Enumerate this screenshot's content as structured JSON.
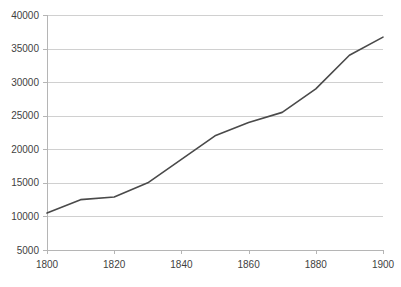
{
  "chart_data": {
    "type": "line",
    "title": "",
    "subtitle": "",
    "xlabel": "",
    "ylabel": "",
    "xlim": [
      1800,
      1900
    ],
    "ylim": [
      5000,
      40000
    ],
    "grid": true,
    "legend": false,
    "legend_position": "none",
    "line_color": "#4a4a4a",
    "gridline_color": "#d0d0d0",
    "axis_color": "#b5b5b5",
    "label_color": "#3f3f3f",
    "background_color": "#ffffff",
    "y_ticks": [
      5000,
      10000,
      15000,
      20000,
      25000,
      30000,
      35000,
      40000
    ],
    "y_tick_labels": [
      "5000",
      "10000",
      "15000",
      "20000",
      "25000",
      "30000",
      "35000",
      "40000"
    ],
    "x_ticks": [
      1800,
      1820,
      1840,
      1860,
      1880,
      1900
    ],
    "x_tick_labels": [
      "1800",
      "1820",
      "1840",
      "1860",
      "1880",
      "1900"
    ],
    "x": [
      1800,
      1810,
      1820,
      1830,
      1840,
      1850,
      1860,
      1870,
      1880,
      1890,
      1900
    ],
    "values": [
      10500,
      12500,
      12900,
      15000,
      18500,
      22000,
      24000,
      25500,
      29000,
      34000,
      36700
    ],
    "series": [
      {
        "name": "series-1",
        "values": [
          10500,
          12500,
          12900,
          15000,
          18500,
          22000,
          24000,
          25500,
          29000,
          34000,
          36700
        ]
      }
    ]
  },
  "plot_geometry": {
    "left": 47,
    "right": 383,
    "top": 15,
    "bottom": 250
  }
}
